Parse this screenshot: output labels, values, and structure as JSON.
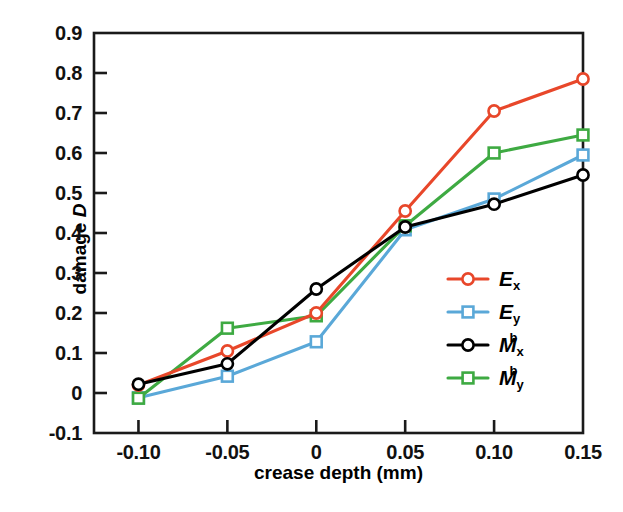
{
  "chart_data": {
    "type": "line",
    "title": "",
    "xlabel": "crease depth (mm)",
    "ylabel_prefix": "damage ",
    "ylabel_var": "D",
    "x": [
      -0.1,
      -0.05,
      0,
      0.05,
      0.1,
      0.15
    ],
    "xtick_labels": [
      "-0.10",
      "-0.05",
      "0",
      "0.05",
      "0.10",
      "0.15"
    ],
    "ytick_labels": [
      "0.9",
      "0.8",
      "0.7",
      "0.6",
      "0.5",
      "0.4",
      "0.3",
      "0.2",
      "0.1",
      "0",
      "-0.1"
    ],
    "ytick_values": [
      0.9,
      0.8,
      0.7,
      0.6,
      0.5,
      0.4,
      0.3,
      0.2,
      0.1,
      0,
      -0.1
    ],
    "xlim": [
      -0.125,
      0.15
    ],
    "ylim": [
      -0.1,
      0.9
    ],
    "grid": false,
    "legend_position": "center-right",
    "series": [
      {
        "name": "E_x",
        "label_base": "E",
        "label_sub": "x",
        "label_sup": "",
        "color": "#e8472a",
        "marker": "circle",
        "values": [
          0.02,
          0.105,
          0.2,
          0.455,
          0.705,
          0.785
        ]
      },
      {
        "name": "E_y",
        "label_base": "E",
        "label_sub": "y",
        "label_sup": "",
        "color": "#5aa8d8",
        "marker": "square",
        "values": [
          -0.012,
          0.042,
          0.128,
          0.408,
          0.485,
          0.595
        ]
      },
      {
        "name": "M_x_b",
        "label_base": "M",
        "label_sub": "x",
        "label_sup": "b",
        "color": "#000000",
        "marker": "circle",
        "values": [
          0.022,
          0.073,
          0.26,
          0.415,
          0.472,
          0.545
        ]
      },
      {
        "name": "M_y_b",
        "label_base": "M",
        "label_sub": "y",
        "label_sup": "b",
        "color": "#3eaa42",
        "marker": "square",
        "values": [
          -0.013,
          0.162,
          0.193,
          0.418,
          0.6,
          0.645
        ]
      }
    ]
  }
}
